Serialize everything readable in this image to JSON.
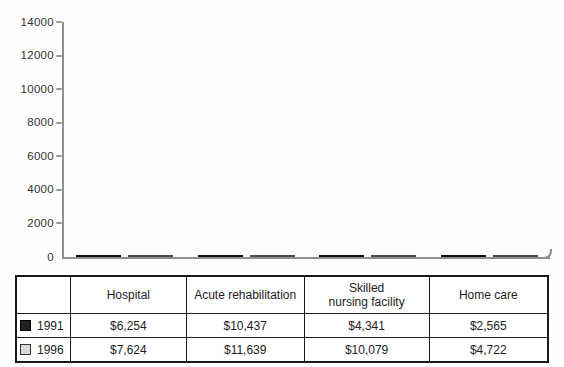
{
  "colors": {
    "background": "#fefefe",
    "axis": "#8f8f8f",
    "tick": "#9a9a9a",
    "axis_label_text": "#333333",
    "table_border": "#1a1a1a",
    "bar_1991": "#212121",
    "bar_1996": "#d9d9d7",
    "bar_1996_border": "#4d4d4d"
  },
  "chart_data": {
    "type": "bar",
    "title": "",
    "xlabel": "",
    "ylabel": "",
    "categories": [
      "Hospital",
      "Acute rehabilitation",
      "Skilled nursing facility",
      "Home care"
    ],
    "series": [
      {
        "name": "1991",
        "color": "#212121",
        "values": [
          6254,
          10437,
          4341,
          2565
        ]
      },
      {
        "name": "1996",
        "color": "#d9d9d7",
        "values": [
          7624,
          11639,
          10079,
          4722
        ]
      }
    ],
    "ylim": [
      0,
      14000
    ],
    "yticks": [
      0,
      2000,
      4000,
      6000,
      8000,
      10000,
      12000,
      14000
    ],
    "grid": false,
    "legend_position": "table-left-column"
  },
  "table": {
    "header": [
      "",
      "Hospital",
      "Acute rehabilitation",
      "Skilled\nnursing facility",
      "Home care"
    ],
    "rows": [
      {
        "year": "1991",
        "swatch": "#212121",
        "values": [
          "$6,254",
          "$10,437",
          "$4,341",
          "$2,565"
        ]
      },
      {
        "year": "1996",
        "swatch": "#d9d9d7",
        "values": [
          "$7,624",
          "$11,639",
          "$10,079",
          "$4,722"
        ]
      }
    ]
  }
}
